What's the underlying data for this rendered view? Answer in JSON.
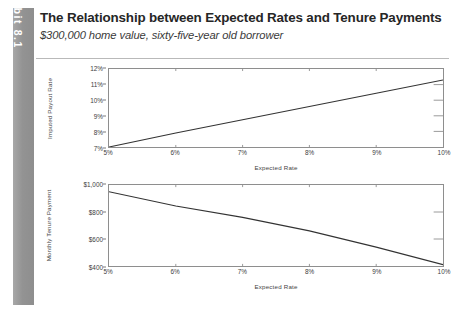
{
  "exhibit": {
    "tab_label": "Exhibit 8.1",
    "tab_color": "#9a9a9a",
    "title": "The Relationship between Expected Rates and Tenure Payments",
    "subtitle": "$300,000 home value, sixty-five-year old borrower"
  },
  "chart_data": [
    {
      "id": "imputed-payout-rate",
      "type": "line",
      "title": "",
      "xlabel": "Expected Rate",
      "ylabel": "Imputed Payout Rate",
      "xlim": [
        5,
        10
      ],
      "ylim": [
        7,
        12
      ],
      "grid": false,
      "legend": "none",
      "line_color": "#333333",
      "xticks": [
        5,
        6,
        7,
        8,
        9,
        10
      ],
      "xticklabels": [
        "5%",
        "6%",
        "7%",
        "8%",
        "9%",
        "10%"
      ],
      "yticks": [
        7,
        8,
        9,
        10,
        11,
        12
      ],
      "yticklabels": [
        "7%",
        "8%",
        "9%",
        "10%",
        "11%",
        "12%"
      ],
      "x": [
        5,
        6,
        7,
        8,
        9,
        10
      ],
      "values": [
        7.0,
        7.9,
        8.75,
        9.6,
        10.45,
        11.3
      ],
      "series": [
        {
          "name": "Imputed Payout Rate",
          "values": [
            7.0,
            7.9,
            8.75,
            9.6,
            10.45,
            11.3
          ]
        }
      ]
    },
    {
      "id": "monthly-tenure-payment",
      "type": "line",
      "title": "",
      "xlabel": "Expected Rate",
      "ylabel": "Monthly Tenure Payment",
      "xlim": [
        5,
        10
      ],
      "ylim": [
        400,
        1000
      ],
      "grid": false,
      "legend": "none",
      "line_color": "#333333",
      "xticks": [
        5,
        6,
        7,
        8,
        9,
        10
      ],
      "xticklabels": [
        "5%",
        "6%",
        "7%",
        "8%",
        "9%",
        "10%"
      ],
      "yticks": [
        400,
        600,
        800,
        1000
      ],
      "yticklabels": [
        "$400",
        "$600",
        "$800",
        "$1,000"
      ],
      "x": [
        5,
        6,
        7,
        8,
        9,
        10
      ],
      "values": [
        950,
        845,
        760,
        660,
        540,
        410
      ],
      "series": [
        {
          "name": "Monthly Tenure Payment",
          "values": [
            950,
            845,
            760,
            660,
            540,
            410
          ]
        }
      ]
    }
  ]
}
